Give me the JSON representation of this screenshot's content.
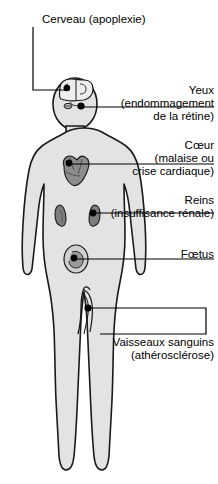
{
  "diagram": {
    "colors": {
      "background": "#ffffff",
      "body_fill": "#e3e3e3",
      "body_outline": "#1a1a1a",
      "organ_fill": "#8c8c8c",
      "organ_dark": "#6b6b6b",
      "marker": "#000000",
      "leader_line": "#000000",
      "text": "#000000"
    },
    "labels": [
      {
        "id": "cerveau",
        "name": "brain",
        "lines": [
          "Cerveau (apoplexie)"
        ]
      },
      {
        "id": "yeux",
        "name": "eyes",
        "lines": [
          "Yeux",
          "(endommagement",
          "de la rétine)"
        ]
      },
      {
        "id": "coeur",
        "name": "heart",
        "lines": [
          "Cœur",
          "(malaise ou",
          "crise cardiaque)"
        ]
      },
      {
        "id": "reins",
        "name": "kidneys",
        "lines": [
          "Reins",
          "(insuffisance rénale)"
        ]
      },
      {
        "id": "foetus",
        "name": "fetus",
        "lines": [
          "Fœtus"
        ]
      },
      {
        "id": "vaisseaux",
        "name": "blood-vessels",
        "lines": [
          "Vaisseaux sanguins",
          "(athérosclérose)"
        ]
      }
    ]
  }
}
